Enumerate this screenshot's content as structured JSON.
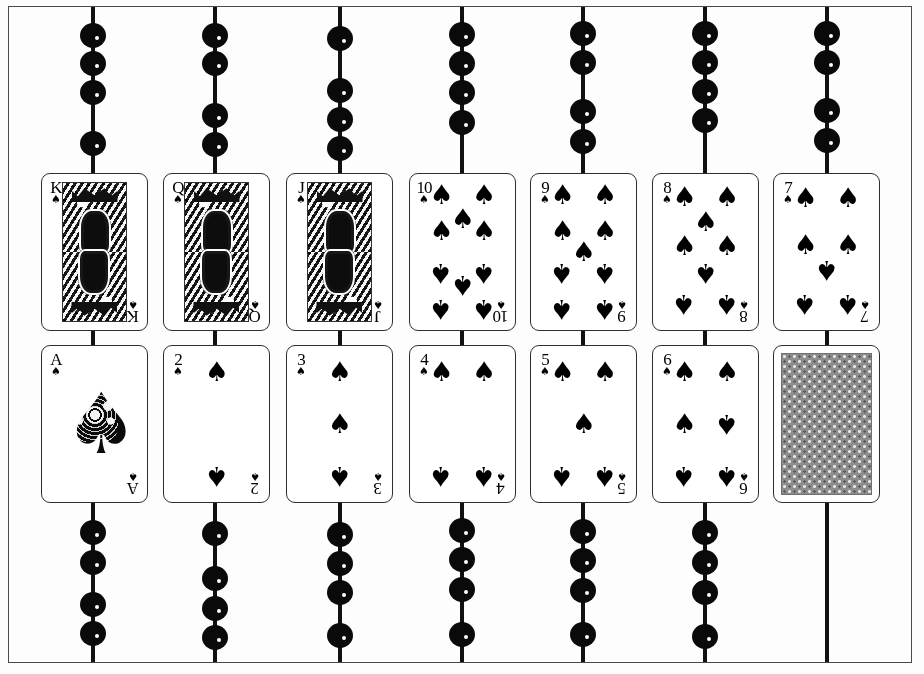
{
  "scene": {
    "title": "Spades suit card display with beaded chains",
    "frame_color": "#4a4a4a",
    "background_color": "#fdfdfd",
    "chain_color": "#111111",
    "bead_color": "#0a0a0a",
    "bead_highlight_color": "#ffffff",
    "card_border_color": "#2e2e2e",
    "card_face_color": "#ffffff",
    "card_back_color": "#8d8d8d",
    "pip_color": "#000000"
  },
  "suit": {
    "name": "spades",
    "glyph": "♠"
  },
  "columns": [
    {
      "index": 0,
      "x": 93,
      "top_beads": [
        35,
        63,
        92,
        143
      ],
      "bottom_beads": [
        532,
        562,
        604,
        633
      ]
    },
    {
      "index": 1,
      "x": 215,
      "top_beads": [
        35,
        63,
        115,
        144
      ],
      "bottom_beads": [
        533,
        578,
        608,
        637
      ]
    },
    {
      "index": 2,
      "x": 340,
      "top_beads": [
        38,
        90,
        119,
        148
      ],
      "bottom_beads": [
        534,
        563,
        592,
        635
      ]
    },
    {
      "index": 3,
      "x": 462,
      "top_beads": [
        34,
        63,
        92,
        122
      ],
      "bottom_beads": [
        530,
        559,
        589,
        634
      ]
    },
    {
      "index": 4,
      "x": 583,
      "top_beads": [
        33,
        62,
        111,
        141
      ],
      "bottom_beads": [
        531,
        560,
        590,
        634
      ]
    },
    {
      "index": 5,
      "x": 705,
      "top_beads": [
        33,
        62,
        91,
        120
      ],
      "bottom_beads": [
        532,
        562,
        592,
        636
      ]
    },
    {
      "index": 6,
      "x": 827,
      "top_beads": [
        33,
        62,
        110,
        140
      ],
      "bottom_beads": []
    }
  ],
  "rows": [
    {
      "name": "top-row",
      "y": 173,
      "cards": [
        {
          "rank": "K",
          "type": "court",
          "x": 41
        },
        {
          "rank": "Q",
          "type": "court",
          "x": 163
        },
        {
          "rank": "J",
          "type": "court",
          "x": 286
        },
        {
          "rank": "10",
          "type": "pip",
          "x": 409,
          "pip_count": 10
        },
        {
          "rank": "9",
          "type": "pip",
          "x": 530,
          "pip_count": 9
        },
        {
          "rank": "8",
          "type": "pip",
          "x": 652,
          "pip_count": 8
        },
        {
          "rank": "7",
          "type": "pip",
          "x": 773,
          "pip_count": 7
        }
      ]
    },
    {
      "name": "bottom-row",
      "y": 345,
      "cards": [
        {
          "rank": "A",
          "type": "ace",
          "x": 41
        },
        {
          "rank": "2",
          "type": "pip",
          "x": 163,
          "pip_count": 2
        },
        {
          "rank": "3",
          "type": "pip",
          "x": 286,
          "pip_count": 3
        },
        {
          "rank": "4",
          "type": "pip",
          "x": 409,
          "pip_count": 4
        },
        {
          "rank": "5",
          "type": "pip",
          "x": 530,
          "pip_count": 5
        },
        {
          "rank": "6",
          "type": "pip",
          "x": 652,
          "pip_count": 6
        },
        {
          "rank": "",
          "type": "back",
          "x": 773
        }
      ]
    }
  ],
  "pip_layouts": {
    "2": [
      [
        50,
        12
      ],
      [
        50,
        88
      ]
    ],
    "3": [
      [
        50,
        12
      ],
      [
        50,
        50
      ],
      [
        50,
        88
      ]
    ],
    "4": [
      [
        15,
        12
      ],
      [
        85,
        12
      ],
      [
        15,
        88
      ],
      [
        85,
        88
      ]
    ],
    "5": [
      [
        15,
        12
      ],
      [
        85,
        12
      ],
      [
        50,
        50
      ],
      [
        15,
        88
      ],
      [
        85,
        88
      ]
    ],
    "6": [
      [
        15,
        12
      ],
      [
        85,
        12
      ],
      [
        15,
        50
      ],
      [
        85,
        50
      ],
      [
        15,
        88
      ],
      [
        85,
        88
      ]
    ],
    "7": [
      [
        15,
        11
      ],
      [
        85,
        11
      ],
      [
        15,
        45
      ],
      [
        85,
        45
      ],
      [
        50,
        63
      ],
      [
        15,
        88
      ],
      [
        85,
        88
      ]
    ],
    "8": [
      [
        15,
        10
      ],
      [
        85,
        10
      ],
      [
        50,
        28
      ],
      [
        15,
        46
      ],
      [
        85,
        46
      ],
      [
        50,
        65
      ],
      [
        15,
        88
      ],
      [
        85,
        88
      ]
    ],
    "9": [
      [
        15,
        9
      ],
      [
        85,
        9
      ],
      [
        15,
        35
      ],
      [
        85,
        35
      ],
      [
        50,
        50
      ],
      [
        15,
        65
      ],
      [
        85,
        65
      ],
      [
        15,
        91
      ],
      [
        85,
        91
      ]
    ],
    "10": [
      [
        15,
        9
      ],
      [
        85,
        9
      ],
      [
        50,
        26
      ],
      [
        15,
        35
      ],
      [
        85,
        35
      ],
      [
        15,
        65
      ],
      [
        85,
        65
      ],
      [
        50,
        74
      ],
      [
        15,
        91
      ],
      [
        85,
        91
      ]
    ]
  },
  "pip_flip_from": {
    "2": 1,
    "3": 2,
    "4": 2,
    "5": 3,
    "6": 3,
    "7": 4,
    "8": 5,
    "9": 5,
    "10": 5
  }
}
